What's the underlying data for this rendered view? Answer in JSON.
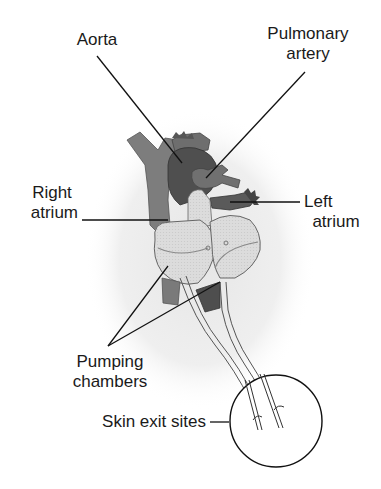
{
  "figure": {
    "type": "anatomical-diagram"
  },
  "labels": {
    "aorta": "Aorta",
    "pulmonary_artery_line1": "Pulmonary",
    "pulmonary_artery_line2": "artery",
    "right_atrium_line1": "Right",
    "right_atrium_line2": "atrium",
    "left_atrium_line1": "Left",
    "left_atrium_line2": "atrium",
    "pumping_chambers_line1": "Pumping",
    "pumping_chambers_line2": "chambers",
    "skin_exit_sites": "Skin exit sites"
  },
  "colors": {
    "vessel_medium": "#7a7a7a",
    "vessel_dark": "#4a4a4a",
    "chamber_fill": "#d8d8d8",
    "background_shading": "#ececec",
    "line": "#111111"
  }
}
